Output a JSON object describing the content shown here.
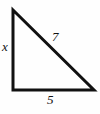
{
  "figure": {
    "type": "right-triangle",
    "background_color": "#fefefe",
    "stroke_color": "#111111",
    "stroke_width": 3,
    "vertices": {
      "top_left": {
        "x": 13,
        "y": 10
      },
      "bottom_left": {
        "x": 13,
        "y": 90
      },
      "bottom_right": {
        "x": 94,
        "y": 90
      }
    },
    "labels": {
      "vertical_leg": "x",
      "hypotenuse": "7",
      "horizontal_leg": "5"
    }
  },
  "chart_data": {
    "type": "diagram",
    "title": "",
    "shape": "right triangle",
    "sides": [
      {
        "name": "vertical-leg",
        "label": "x",
        "value": null,
        "from": "top_left",
        "to": "bottom_left"
      },
      {
        "name": "hypotenuse",
        "label": "7",
        "value": 7,
        "from": "top_left",
        "to": "bottom_right"
      },
      {
        "name": "horizontal-leg",
        "label": "5",
        "value": 5,
        "from": "bottom_left",
        "to": "bottom_right"
      }
    ],
    "right_angle_at": "bottom_left"
  }
}
